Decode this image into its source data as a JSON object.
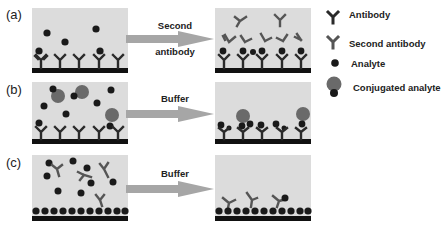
{
  "figure": {
    "rows": [
      {
        "label": "(a)",
        "step": "Second\nantibody",
        "step_line1": "Second",
        "step_line2": "antibody"
      },
      {
        "label": "(b)",
        "step": "Buffer"
      },
      {
        "label": "(c)",
        "step": "Buffer"
      }
    ]
  },
  "legend": {
    "items": [
      {
        "label": "Antibody",
        "icon": "antibody-icon",
        "color": "#2a2a2a"
      },
      {
        "label": "Second antibody",
        "icon": "second-antibody-icon",
        "color": "#555555"
      },
      {
        "label": "Analyte",
        "icon": "analyte-icon",
        "color": "#1a1a1a"
      },
      {
        "label": "Conjugated analyte",
        "icon": "conjugated-analyte-icon",
        "color": "#6a6a6a"
      }
    ]
  },
  "colors": {
    "panel_bg": "#dcdcdc",
    "substrate": "#111111",
    "arrow": "#a6a6a6",
    "analyte": "#1a1a1a",
    "conjugate": "#6a6a6a"
  }
}
